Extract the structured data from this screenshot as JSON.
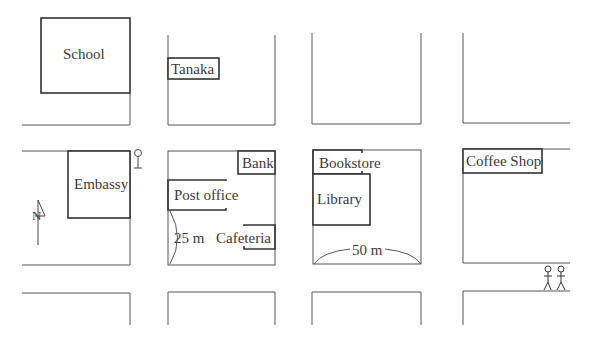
{
  "map": {
    "compass": {
      "label": "N",
      "icon": "north-arrow-icon"
    },
    "buildings": [
      {
        "id": "school",
        "label": "School"
      },
      {
        "id": "tanaka",
        "label": "Tanaka"
      },
      {
        "id": "embassy",
        "label": "Embassy"
      },
      {
        "id": "bank",
        "label": "Bank"
      },
      {
        "id": "post-office",
        "label": "Post office"
      },
      {
        "id": "cafeteria",
        "label": "Cafeteria"
      },
      {
        "id": "bookstore",
        "label": "Bookstore"
      },
      {
        "id": "library",
        "label": "Library"
      },
      {
        "id": "coffee-shop",
        "label": "Coffee Shop"
      }
    ],
    "distances": [
      {
        "id": "block-height",
        "label": "25 m"
      },
      {
        "id": "block-width",
        "label": "50 m"
      }
    ],
    "symbols": [
      {
        "id": "bus-stop",
        "icon": "bus-stop-sign-icon"
      },
      {
        "id": "pedestrians",
        "icon": "pedestrians-icon"
      }
    ]
  }
}
